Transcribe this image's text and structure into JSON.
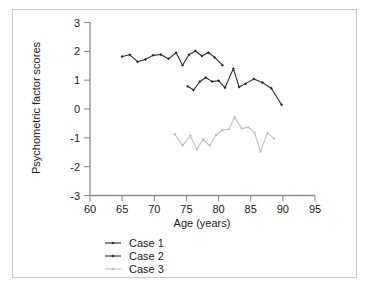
{
  "figure": {
    "background_color": "#ffffff",
    "frame_color": "#c9c9c9"
  },
  "chart_data": {
    "type": "line",
    "title": "",
    "xlabel": "Age (years)",
    "ylabel": "Psychometric factor scores",
    "xlim": [
      60,
      95
    ],
    "ylim": [
      -3,
      3
    ],
    "xticks": [
      60,
      65,
      70,
      75,
      80,
      85,
      90,
      95
    ],
    "yticks": [
      3,
      2,
      1,
      0,
      -1,
      -2,
      -3
    ],
    "xtick_labels": [
      "60",
      "65",
      "70",
      "75",
      "80",
      "85",
      "90",
      "95"
    ],
    "ytick_labels": [
      "3",
      "2",
      "1",
      "0",
      "-1",
      "-2",
      "-3"
    ],
    "grid": false,
    "legend_position": "below-left",
    "series": [
      {
        "name": "Case 1",
        "color": "#2b2b2b",
        "marker": "diamond",
        "x": [
          65.0,
          66.2,
          67.4,
          68.6,
          69.8,
          71.0,
          72.2,
          73.4,
          74.4,
          75.4,
          76.4,
          77.4,
          78.4,
          79.4,
          80.6
        ],
        "y": [
          1.82,
          1.88,
          1.64,
          1.72,
          1.86,
          1.89,
          1.74,
          1.95,
          1.52,
          1.88,
          2.01,
          1.84,
          1.96,
          1.79,
          1.52
        ]
      },
      {
        "name": "Case 2",
        "color": "#2b2b2b",
        "marker": "diamond",
        "x": [
          75.2,
          76.1,
          77.1,
          78.0,
          79.0,
          80.0,
          81.0,
          82.3,
          83.2,
          84.2,
          85.5,
          86.8,
          88.2,
          89.8
        ],
        "y": [
          0.79,
          0.66,
          0.95,
          1.09,
          0.95,
          0.98,
          0.74,
          1.4,
          0.76,
          0.88,
          1.04,
          0.92,
          0.72,
          0.15
        ]
      },
      {
        "name": "Case 3",
        "color": "#c0c0c0",
        "marker": "diamond",
        "x": [
          73.2,
          74.4,
          75.6,
          76.6,
          77.6,
          78.6,
          79.6,
          80.6,
          81.6,
          82.5,
          83.6,
          84.6,
          85.6,
          86.5,
          87.6,
          88.6
        ],
        "y": [
          -0.88,
          -1.27,
          -0.93,
          -1.4,
          -1.05,
          -1.27,
          -0.9,
          -0.73,
          -0.7,
          -0.29,
          -0.68,
          -0.63,
          -0.82,
          -1.48,
          -0.83,
          -1.02
        ]
      }
    ]
  },
  "legend": {
    "items": [
      {
        "label": "Case 1",
        "color": "#2b2b2b"
      },
      {
        "label": "Case 2",
        "color": "#2b2b2b"
      },
      {
        "label": "Case 3",
        "color": "#c0c0c0"
      }
    ]
  }
}
